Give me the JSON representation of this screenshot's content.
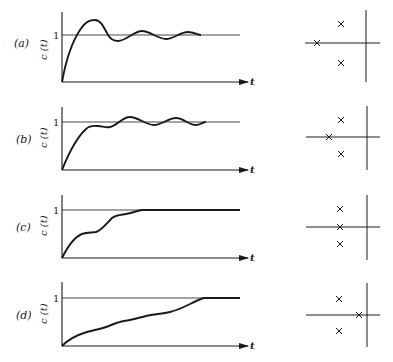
{
  "figure": {
    "y_axis_label": "c (t)",
    "x_axis_label": "t",
    "reference_level_label": "1",
    "stroke_color": "#1a1a1a"
  },
  "panels": [
    {
      "label": "(a)",
      "response": "oscillatory: large overshoot then decaying oscillation about 1",
      "poles": [
        {
          "kind": "real",
          "position": "far left on real axis"
        },
        {
          "kind": "complex",
          "position": "upper, lightly damped"
        },
        {
          "kind": "complex",
          "position": "lower, lightly damped"
        }
      ]
    },
    {
      "label": "(b)",
      "response": "rises to near 1 with small plateau, then small oscillations about 1",
      "poles": [
        {
          "kind": "real",
          "position": "left, nearer complex pair"
        },
        {
          "kind": "complex",
          "position": "upper"
        },
        {
          "kind": "complex",
          "position": "lower"
        }
      ]
    },
    {
      "label": "(c)",
      "response": "staircase-like rise with no overshoot, settles at 1",
      "poles": [
        {
          "kind": "real",
          "position": "same real part as complex pair"
        },
        {
          "kind": "complex",
          "position": "upper"
        },
        {
          "kind": "complex",
          "position": "lower"
        }
      ]
    },
    {
      "label": "(d)",
      "response": "slow, nearly linear rise with slight ripples, reaches 1 late",
      "poles": [
        {
          "kind": "real",
          "position": "near imaginary axis (dominant)"
        },
        {
          "kind": "complex",
          "position": "upper"
        },
        {
          "kind": "complex",
          "position": "lower"
        }
      ]
    }
  ]
}
